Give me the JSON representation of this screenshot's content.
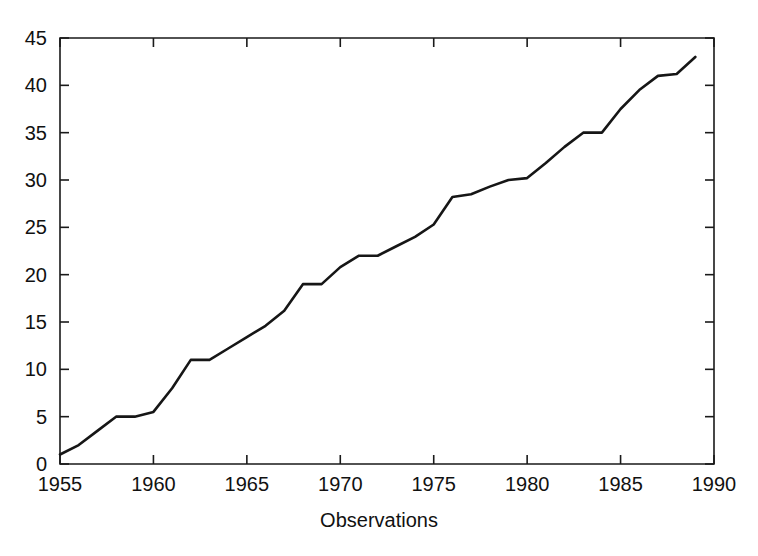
{
  "chart_data": {
    "type": "line",
    "title": "",
    "xlabel": "Observations",
    "ylabel": "",
    "xlim": [
      1955,
      1990
    ],
    "ylim": [
      0,
      45
    ],
    "grid": false,
    "legend": false,
    "xticks": [
      1955,
      1960,
      1965,
      1970,
      1975,
      1980,
      1985,
      1990
    ],
    "xtick_labels": [
      "1955",
      "1960",
      "1965",
      "1970",
      "1975",
      "1980",
      "1985",
      "1990"
    ],
    "yticks": [
      0,
      5,
      10,
      15,
      20,
      25,
      30,
      35,
      40,
      45
    ],
    "ytick_labels": [
      "0",
      "5",
      "10",
      "15",
      "20",
      "25",
      "30",
      "35",
      "40",
      "45"
    ],
    "x": [
      1955,
      1956,
      1957,
      1958,
      1959,
      1960,
      1961,
      1962,
      1963,
      1964,
      1965,
      1966,
      1967,
      1968,
      1969,
      1970,
      1971,
      1972,
      1973,
      1974,
      1975,
      1976,
      1977,
      1978,
      1979,
      1980,
      1981,
      1982,
      1983,
      1984,
      1985,
      1986,
      1987,
      1988,
      1989
    ],
    "values": [
      1,
      2,
      3.5,
      5,
      5,
      5.5,
      8,
      11,
      11,
      12.2,
      13.4,
      14.6,
      16.2,
      19,
      19,
      20.8,
      22,
      22,
      23,
      24,
      25.3,
      28.2,
      28.5,
      29.3,
      30,
      30.2,
      31.8,
      33.5,
      35,
      35,
      37.5,
      39.5,
      41,
      41.2,
      43
    ],
    "series": [
      {
        "name": "observations",
        "color": "#161616",
        "values": [
          1,
          2,
          3.5,
          5,
          5,
          5.5,
          8,
          11,
          11,
          12.2,
          13.4,
          14.6,
          16.2,
          19,
          19,
          20.8,
          22,
          22,
          23,
          24,
          25.3,
          28.2,
          28.5,
          29.3,
          30,
          30.2,
          31.8,
          33.5,
          35,
          35,
          37.5,
          39.5,
          41,
          41.2,
          43
        ]
      }
    ]
  },
  "axis": {
    "x_title": "Observations"
  }
}
